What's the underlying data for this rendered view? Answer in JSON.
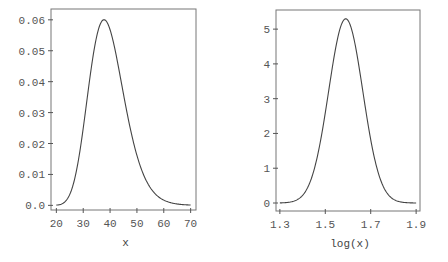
{
  "chart_data": [
    {
      "type": "line",
      "title": "",
      "xlabel": "x",
      "ylabel": "",
      "xlim": [
        18,
        72
      ],
      "ylim": [
        -0.0015,
        0.0635
      ],
      "xticks": [
        20,
        30,
        40,
        50,
        60,
        70
      ],
      "xtick_labels": [
        "20",
        "30",
        "40",
        "50",
        "60",
        "70"
      ],
      "yticks": [
        0.0,
        0.01,
        0.02,
        0.03,
        0.04,
        0.05,
        0.06
      ],
      "ytick_labels": [
        "0.0",
        "0.01",
        "0.02",
        "0.03",
        "0.04",
        "0.05",
        "0.06"
      ],
      "grid": false,
      "series": [
        {
          "name": "lognormal density",
          "x": [
            20,
            24,
            28,
            30,
            32,
            34,
            36,
            38,
            40,
            42,
            44,
            46,
            48,
            50,
            54,
            58,
            62,
            66,
            70
          ],
          "y": [
            0.0006,
            0.0037,
            0.0143,
            0.0235,
            0.0345,
            0.0458,
            0.0552,
            0.0608,
            0.0616,
            0.0579,
            0.0509,
            0.042,
            0.0329,
            0.0247,
            0.0127,
            0.0059,
            0.0026,
            0.0011,
            0.0004
          ]
        }
      ],
      "frame_px": {
        "left": 51,
        "top": 9,
        "right": 196,
        "bottom": 210
      }
    },
    {
      "type": "line",
      "title": "",
      "xlabel": "log(x)",
      "ylabel": "",
      "xlim": [
        1.283,
        1.917
      ],
      "ylim": [
        -0.23,
        5.55
      ],
      "xticks": [
        1.3,
        1.5,
        1.7,
        1.9
      ],
      "xtick_labels": [
        "1.3",
        "1.5",
        "1.7",
        "1.9"
      ],
      "yticks": [
        0,
        1,
        2,
        3,
        4,
        5
      ],
      "ytick_labels": [
        "0",
        "1",
        "2",
        "3",
        "4",
        "5"
      ],
      "grid": false,
      "series": [
        {
          "name": "normal density of log(x)",
          "x": [
            1.3,
            1.35,
            1.4,
            1.43,
            1.46,
            1.49,
            1.52,
            1.55,
            1.57,
            1.59,
            1.61,
            1.63,
            1.66,
            1.69,
            1.72,
            1.75,
            1.8,
            1.85,
            1.9
          ],
          "y": [
            0.003,
            0.034,
            0.22,
            0.55,
            1.19,
            2.19,
            3.43,
            4.54,
            5.08,
            5.3,
            5.08,
            4.54,
            3.43,
            2.19,
            1.19,
            0.55,
            0.11,
            0.011,
            0.0006
          ]
        }
      ],
      "frame_px": {
        "left": 276,
        "top": 10,
        "right": 420,
        "bottom": 211
      }
    }
  ],
  "curve_params": [
    {
      "kind": "lognormal",
      "mu_log10": 1.59,
      "sigma_log10": 0.0753
    },
    {
      "kind": "normal",
      "mu": 1.59,
      "sigma": 0.0753
    }
  ]
}
